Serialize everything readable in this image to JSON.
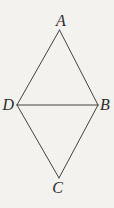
{
  "figure": {
    "type": "geometry-diagram",
    "background_color": "#f3f2ef",
    "stroke_color": "#45433f",
    "label_color": "#2e2d2a",
    "stroke_width": 1,
    "vertices": {
      "A": {
        "label": "A",
        "x": 59.5,
        "y": 30,
        "label_x": 61,
        "label_y": 26,
        "anchor": "middle"
      },
      "B": {
        "label": "B",
        "x": 98,
        "y": 105,
        "label_x": 100,
        "label_y": 110,
        "anchor": "start"
      },
      "C": {
        "label": "C",
        "x": 59,
        "y": 178,
        "label_x": 57.5,
        "label_y": 193,
        "anchor": "middle"
      },
      "D": {
        "label": "D",
        "x": 17,
        "y": 105,
        "label_x": 14,
        "label_y": 110,
        "anchor": "end"
      }
    },
    "edges": [
      {
        "from": "A",
        "to": "D"
      },
      {
        "from": "A",
        "to": "B"
      },
      {
        "from": "D",
        "to": "B"
      },
      {
        "from": "D",
        "to": "C"
      },
      {
        "from": "B",
        "to": "C"
      }
    ]
  }
}
